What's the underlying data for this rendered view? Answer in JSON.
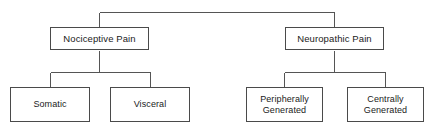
{
  "diagram": {
    "type": "hierarchy-tree",
    "orientation": "top-down",
    "colors": {
      "background": "#ffffff",
      "box_border": "#4a4a4a",
      "connector_line": "#555555",
      "text": "#1a1a1a"
    },
    "root_connector": {
      "name": "root-bracket",
      "y": 12,
      "x_left": 99,
      "x_right": 334
    },
    "levels": [
      {
        "level": 1,
        "nodes": [
          {
            "id": "nociceptive-pain",
            "label": "Nociceptive Pain",
            "x": 50,
            "y": 27,
            "width": 99,
            "height": 23,
            "center_x": 99
          },
          {
            "id": "neuropathic-pain",
            "label": "Neuropathic Pain",
            "x": 285,
            "y": 27,
            "width": 99,
            "height": 23,
            "center_x": 334
          }
        ]
      },
      {
        "level": 2,
        "nodes": [
          {
            "id": "somatic",
            "label": "Somatic",
            "parent": "nociceptive-pain",
            "x": 10,
            "y": 87,
            "width": 80,
            "height": 35,
            "center_x": 50
          },
          {
            "id": "visceral",
            "label": "Visceral",
            "parent": "nociceptive-pain",
            "x": 110,
            "y": 87,
            "width": 80,
            "height": 35,
            "center_x": 150
          },
          {
            "id": "peripherally-generated",
            "label": "Peripherally\nGenerated",
            "parent": "neuropathic-pain",
            "x": 246,
            "y": 87,
            "width": 77,
            "height": 35,
            "center_x": 284
          },
          {
            "id": "centrally-generated",
            "label": "Centrally\nGenerated",
            "parent": "neuropathic-pain",
            "x": 347,
            "y": 87,
            "width": 77,
            "height": 35,
            "center_x": 385
          }
        ]
      }
    ],
    "connectors": [
      {
        "name": "root-stem-left",
        "points": "99,12 99,27"
      },
      {
        "name": "root-stem-right",
        "points": "334,12 334,27"
      },
      {
        "name": "root-bracket-bar",
        "points": "99,12 334,12"
      },
      {
        "name": "nociceptive-stem",
        "points": "99,50 99,72"
      },
      {
        "name": "nociceptive-bar",
        "points": "50,72 150,72"
      },
      {
        "name": "somatic-stem",
        "points": "50,72 50,87"
      },
      {
        "name": "visceral-stem",
        "points": "150,72 150,87"
      },
      {
        "name": "neuropathic-stem",
        "points": "334,50 334,72"
      },
      {
        "name": "neuropathic-bar",
        "points": "284,72 385,72"
      },
      {
        "name": "peripherally-stem",
        "points": "284,72 284,87"
      },
      {
        "name": "centrally-stem",
        "points": "385,72 385,87"
      }
    ]
  }
}
